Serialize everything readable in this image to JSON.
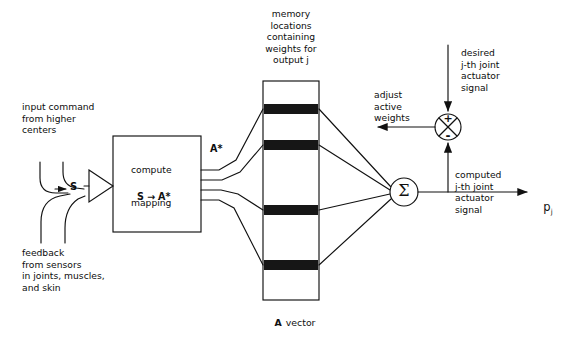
{
  "figure": {
    "type": "block-diagram",
    "stroke_color": "#111111",
    "band_color": "#161616",
    "background": "#ffffff"
  },
  "labels": {
    "input_command": "input command\nfrom higher\ncenters",
    "feedback": "feedback\nfrom sensors\nin joints, muscles,\nand skin",
    "s_symbol": "S",
    "compute_line1": "compute",
    "compute_line2_left": "S",
    "compute_line2_arrow": "→",
    "compute_line2_right": "A*",
    "compute_line3": "mapping",
    "a_star": "A*",
    "memory_caption": "memory\nlocations\ncontaining\nweights for\noutput j",
    "a_vector_bold": "A",
    "a_vector_rest": "vector",
    "adjust_active_weights": "adjust\nactive\nweights",
    "desired_signal": "desired\nj-th joint\nactuator\nsignal",
    "computed_signal": "computed\nj-th joint\nactuator\nsignal",
    "sigma_symbol": "Σ",
    "plus_sign": "+",
    "minus_sign": "-",
    "output_p": "p",
    "output_p_subscript": "j"
  },
  "geometry": {
    "compute_box": {
      "x": 113,
      "y": 136,
      "w": 88,
      "h": 96
    },
    "memory_column": {
      "x": 263,
      "y": 81,
      "w": 56,
      "h": 219
    },
    "memory_bands_y": [
      104,
      140,
      205,
      260
    ],
    "memory_band_height": 10,
    "summing_junction": {
      "cx": 448,
      "cy": 127,
      "r": 13
    },
    "sigma_node": {
      "cx": 404,
      "cy": 192,
      "r": 14
    },
    "s_triangle": {
      "x": 89,
      "y": 170,
      "w": 24,
      "h": 32
    },
    "output_arrow_y": 196
  }
}
